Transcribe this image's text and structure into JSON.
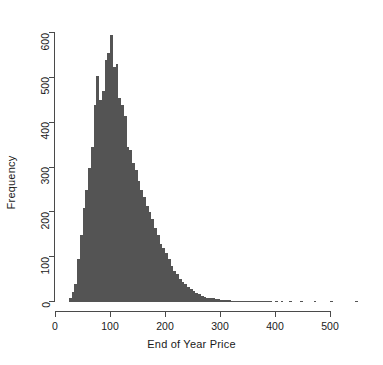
{
  "chart_data": {
    "type": "bar",
    "subtype": "histogram",
    "title": "",
    "xlabel": "End of Year Price",
    "ylabel": "Frequency",
    "xlim": [
      0,
      550
    ],
    "ylim": [
      0,
      600
    ],
    "xticks": [
      0,
      100,
      200,
      300,
      400,
      500
    ],
    "xtick_labels": [
      "0",
      "100",
      "200",
      "300",
      "400",
      "500"
    ],
    "yticks": [
      0,
      100,
      200,
      300,
      400,
      500,
      600
    ],
    "ytick_labels": [
      "0",
      "100",
      "200",
      "300",
      "400",
      "500",
      "600"
    ],
    "grid": false,
    "legend": false,
    "bar_color": "#545454",
    "axis_color": "#4a4a4a",
    "bin_width": 5,
    "bin_starts": [
      25,
      30,
      35,
      40,
      45,
      50,
      55,
      60,
      65,
      70,
      75,
      80,
      85,
      90,
      95,
      100,
      105,
      110,
      115,
      120,
      125,
      130,
      135,
      140,
      145,
      150,
      155,
      160,
      165,
      170,
      175,
      180,
      185,
      190,
      195,
      200,
      205,
      210,
      215,
      220,
      225,
      230,
      235,
      240,
      245,
      250,
      255,
      260,
      265,
      270,
      275,
      280,
      285,
      290,
      295,
      300,
      305,
      310,
      315,
      320,
      325,
      330,
      335,
      340,
      345,
      350,
      355,
      360,
      365,
      370,
      375,
      380,
      385,
      390,
      395,
      400,
      405,
      410,
      415,
      420,
      425,
      430,
      435,
      440,
      445,
      450,
      455,
      460,
      465,
      470,
      475,
      480,
      485,
      490,
      495,
      500,
      505,
      510,
      515,
      520,
      525,
      530,
      535,
      540,
      545
    ],
    "values": [
      8,
      22,
      40,
      95,
      150,
      210,
      250,
      300,
      345,
      440,
      505,
      450,
      470,
      540,
      555,
      595,
      525,
      530,
      455,
      440,
      415,
      345,
      340,
      310,
      295,
      270,
      250,
      235,
      215,
      200,
      185,
      165,
      150,
      130,
      120,
      110,
      95,
      80,
      70,
      62,
      52,
      45,
      40,
      33,
      28,
      24,
      20,
      17,
      14,
      12,
      10,
      9,
      8,
      7,
      6,
      5,
      5,
      4,
      4,
      3,
      3,
      3,
      2,
      2,
      2,
      2,
      1,
      1,
      1,
      1,
      1,
      1,
      1,
      1,
      0,
      1,
      0,
      1,
      0,
      0,
      1,
      0,
      0,
      0,
      1,
      0,
      0,
      0,
      0,
      1,
      0,
      0,
      0,
      0,
      0,
      1,
      0,
      0,
      0,
      0,
      0,
      0,
      0,
      0,
      1
    ]
  }
}
